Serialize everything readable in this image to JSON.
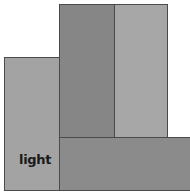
{
  "blocks": [
    {
      "id": "left",
      "label": "light",
      "color": "#a3a3a3"
    },
    {
      "id": "middle-top",
      "label": "",
      "color": "#868686"
    },
    {
      "id": "right-top",
      "label": "",
      "color": "#a7a7a7"
    },
    {
      "id": "bottom",
      "label": "",
      "color": "#8b8b8b"
    }
  ]
}
